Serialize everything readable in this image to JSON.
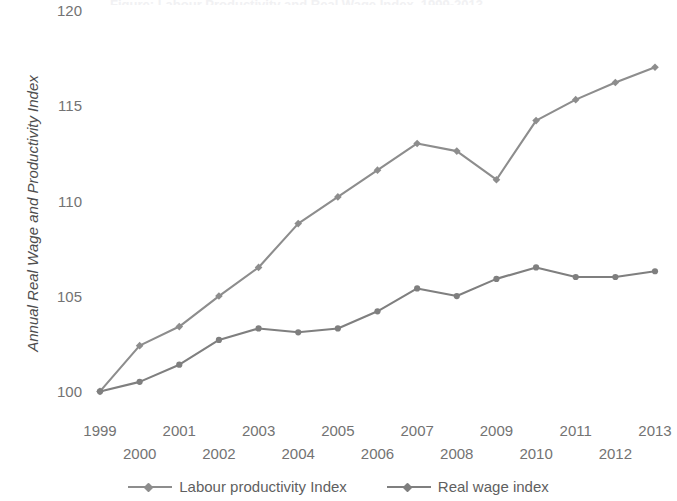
{
  "title_sliver": "Figure: Labour Productivity and Real Wage Index, 1999-2013",
  "axes": {
    "y_title": "Annual Real Wage and Productivity Index",
    "y_ticks": [
      "120",
      "115",
      "110",
      "105",
      "100"
    ],
    "x_ticks": [
      "1999",
      "2000",
      "2001",
      "2002",
      "2003",
      "2004",
      "2005",
      "2006",
      "2007",
      "2008",
      "2009",
      "2010",
      "2011",
      "2012",
      "2013"
    ]
  },
  "legend": {
    "entries": [
      {
        "label": "Labour productivity Index",
        "color": "#8d8d8d",
        "marker": "diamond-marker"
      },
      {
        "label": "Real wage index",
        "color": "#7f7f7f",
        "marker": "diamond-marker"
      }
    ]
  },
  "chart_data": {
    "type": "line",
    "title": "",
    "xlabel": "",
    "ylabel": "Annual Real Wage and Productivity Index",
    "categories": [
      1999,
      2000,
      2001,
      2002,
      2003,
      2004,
      2005,
      2006,
      2007,
      2008,
      2009,
      2010,
      2011,
      2012,
      2013
    ],
    "x": [
      1999,
      2000,
      2001,
      2002,
      2003,
      2004,
      2005,
      2006,
      2007,
      2008,
      2009,
      2010,
      2011,
      2012,
      2013
    ],
    "ylim": [
      98.5,
      120
    ],
    "yticks": [
      100,
      105,
      110,
      115,
      120
    ],
    "grid": false,
    "legend_position": "bottom",
    "series": [
      {
        "name": "Labour productivity Index",
        "color": "#8d8d8d",
        "marker": "diamond",
        "values": [
          100.0,
          102.4,
          103.4,
          105.0,
          106.5,
          108.8,
          110.2,
          111.6,
          113.0,
          112.6,
          111.1,
          114.2,
          115.3,
          116.2,
          117.0
        ]
      },
      {
        "name": "Real wage index",
        "color": "#7f7f7f",
        "marker": "circle",
        "values": [
          100.0,
          100.5,
          101.4,
          102.7,
          103.3,
          103.1,
          103.3,
          104.2,
          105.4,
          105.0,
          105.9,
          106.5,
          106.0,
          106.0,
          106.3
        ]
      }
    ]
  }
}
